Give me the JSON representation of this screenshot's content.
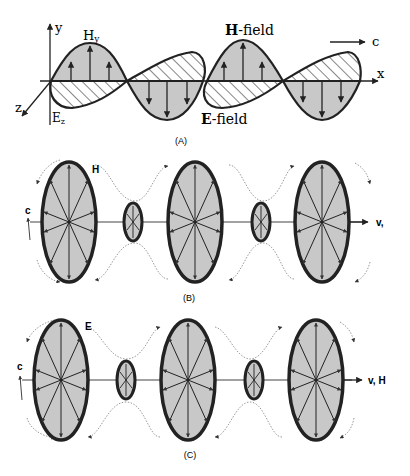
{
  "panel_a": {
    "label": "(A)",
    "axis_y": "y",
    "axis_x": "x",
    "axis_z": "z",
    "hy_label": "H",
    "hy_sub": "y",
    "ez_label": "E",
    "ez_sub": "z",
    "h_field_bold": "H",
    "h_field_rest": "-field",
    "e_field_bold": "E",
    "e_field_rest": "-field",
    "c_label": "c"
  },
  "panel_b": {
    "label": "(B)",
    "field_label": "H",
    "c_label": "c",
    "v_label": "v,"
  },
  "panel_c": {
    "label": "(C)",
    "field_label": "E",
    "c_label": "c",
    "v_label": "v, H"
  },
  "colors": {
    "fill": "#c8c8c8",
    "stroke": "#222222",
    "dotted": "#999999"
  }
}
